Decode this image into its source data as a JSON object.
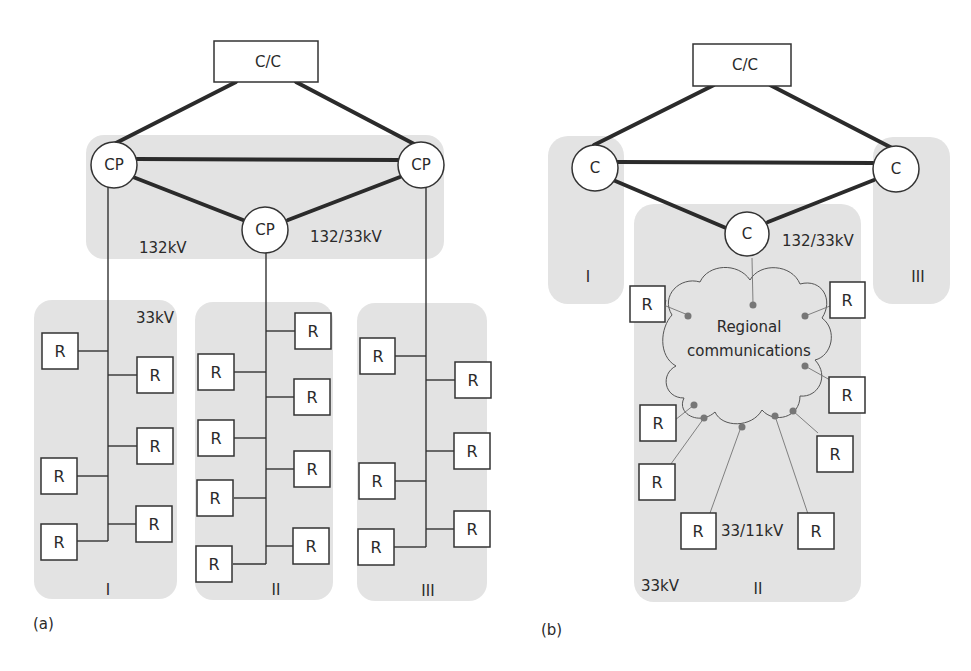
{
  "panel_a": {
    "caption": "(a)",
    "control_centre": "C/C",
    "control_points": [
      "CP",
      "CP",
      "CP"
    ],
    "label_132kv": "132kV",
    "label_132_33kv": "132/33kV",
    "label_33kv": "33kV",
    "regions": [
      {
        "roman": "I",
        "rtus": [
          "R",
          "R",
          "R",
          "R",
          "R",
          "R"
        ]
      },
      {
        "roman": "II",
        "rtus": [
          "R",
          "R",
          "R",
          "R",
          "R",
          "R",
          "R",
          "R"
        ]
      },
      {
        "roman": "III",
        "rtus": [
          "R",
          "R",
          "R",
          "R",
          "R",
          "R"
        ]
      }
    ]
  },
  "panel_b": {
    "caption": "(b)",
    "control_centre": "C/C",
    "controllers": [
      "C",
      "C",
      "C"
    ],
    "label_132_33kv": "132/33kV",
    "cloud_line1": "Regional",
    "cloud_line2": "communications",
    "label_33_11kv": "33/11kV",
    "label_33kv": "33kV",
    "regions": [
      {
        "roman": "I"
      },
      {
        "roman": "II",
        "rtus": [
          "R",
          "R",
          "R",
          "R",
          "R",
          "R",
          "R",
          "R"
        ]
      },
      {
        "roman": "III"
      }
    ]
  }
}
